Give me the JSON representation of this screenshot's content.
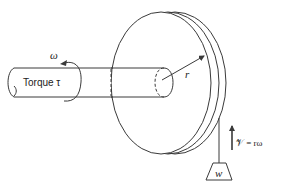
{
  "diagram": {
    "labels": {
      "torque": "Torque τ",
      "omega": "ω",
      "radius": "r",
      "velocity": "𝒱 = rω",
      "weight": "w"
    },
    "colors": {
      "line": "#3a3a3a",
      "background": "#ffffff"
    },
    "components": [
      "shaft",
      "flywheel-disc",
      "radius-arrow",
      "rotation-arrow",
      "rope",
      "weight",
      "velocity-arrow"
    ]
  }
}
